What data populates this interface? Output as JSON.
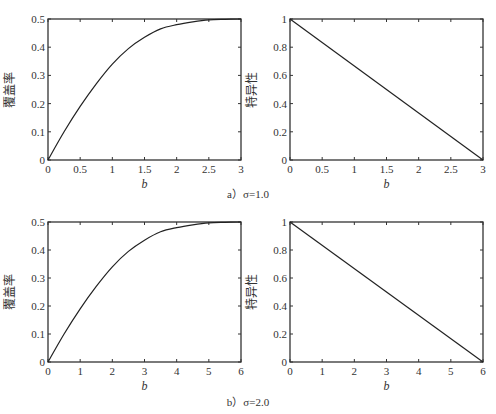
{
  "figure": {
    "captions": [
      "a）σ=1.0",
      "b）σ=2.0"
    ]
  },
  "chart_data": [
    {
      "id": "a-left",
      "type": "line",
      "title": "",
      "xlabel": "b",
      "ylabel": "覆盖率",
      "xlim": [
        0,
        3
      ],
      "ylim": [
        0,
        0.5
      ],
      "xticks": [
        "0",
        "0.5",
        "1",
        "1.5",
        "2",
        "2.5",
        "3"
      ],
      "yticks": [
        "0",
        "0.1",
        "0.2",
        "0.3",
        "0.4",
        "0.5"
      ],
      "grid": false,
      "series": [
        {
          "name": "覆盖率",
          "x": [
            0,
            0.25,
            0.5,
            0.75,
            1.0,
            1.25,
            1.5,
            1.75,
            2.0,
            2.25,
            2.5,
            2.75,
            3.0
          ],
          "y": [
            0,
            0.1,
            0.19,
            0.27,
            0.34,
            0.395,
            0.435,
            0.465,
            0.48,
            0.49,
            0.497,
            0.499,
            0.5
          ]
        }
      ]
    },
    {
      "id": "a-right",
      "type": "line",
      "title": "",
      "xlabel": "b",
      "ylabel": "特异性",
      "xlim": [
        0,
        3
      ],
      "ylim": [
        0,
        1
      ],
      "xticks": [
        "0",
        "0.5",
        "1",
        "1.5",
        "2",
        "2.5",
        "3"
      ],
      "yticks": [
        "0",
        "0.2",
        "0.4",
        "0.6",
        "0.8",
        "1"
      ],
      "grid": false,
      "series": [
        {
          "name": "特异性",
          "x": [
            0,
            3
          ],
          "y": [
            1,
            0
          ]
        }
      ]
    },
    {
      "id": "b-left",
      "type": "line",
      "title": "",
      "xlabel": "b",
      "ylabel": "覆盖率",
      "xlim": [
        0,
        6
      ],
      "ylim": [
        0,
        0.5
      ],
      "xticks": [
        "0",
        "1",
        "2",
        "3",
        "4",
        "5",
        "6"
      ],
      "yticks": [
        "0",
        "0.1",
        "0.2",
        "0.3",
        "0.4",
        "0.5"
      ],
      "grid": false,
      "series": [
        {
          "name": "覆盖率",
          "x": [
            0,
            0.5,
            1.0,
            1.5,
            2.0,
            2.5,
            3.0,
            3.5,
            4.0,
            4.5,
            5.0,
            5.5,
            6.0
          ],
          "y": [
            0,
            0.1,
            0.19,
            0.27,
            0.34,
            0.395,
            0.435,
            0.465,
            0.48,
            0.49,
            0.497,
            0.499,
            0.5
          ]
        }
      ]
    },
    {
      "id": "b-right",
      "type": "line",
      "title": "",
      "xlabel": "b",
      "ylabel": "特异性",
      "xlim": [
        0,
        6
      ],
      "ylim": [
        0,
        1
      ],
      "xticks": [
        "0",
        "1",
        "2",
        "3",
        "4",
        "5",
        "6"
      ],
      "yticks": [
        "0",
        "0.2",
        "0.4",
        "0.6",
        "0.8",
        "1"
      ],
      "grid": false,
      "series": [
        {
          "name": "特异性",
          "x": [
            0,
            6
          ],
          "y": [
            1,
            0
          ]
        }
      ]
    }
  ]
}
